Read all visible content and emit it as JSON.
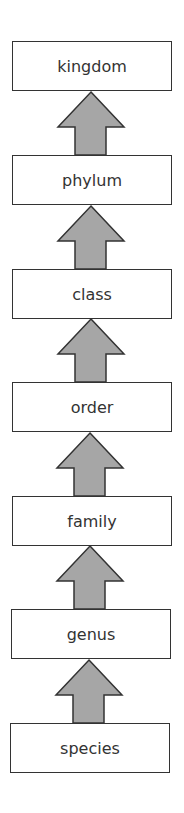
{
  "diagram": {
    "levels": [
      {
        "label": "kingdom"
      },
      {
        "label": "phylum"
      },
      {
        "label": "class"
      },
      {
        "label": "order"
      },
      {
        "label": "family"
      },
      {
        "label": "genus"
      },
      {
        "label": "species"
      }
    ],
    "arrow_direction": "up",
    "colors": {
      "arrow_fill": "#a6a6a6",
      "stroke": "#333333",
      "box_fill": "#ffffff"
    }
  }
}
